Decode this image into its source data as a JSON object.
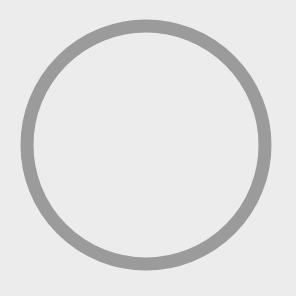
{
  "canvas": {
    "width": 296,
    "height": 296,
    "background_color": "#ececec"
  },
  "ring": {
    "shape": "circle-outline",
    "center_x": 146,
    "center_y": 145,
    "radius": 119,
    "stroke_width": 13,
    "stroke_color": "#9b9b9b",
    "fill": "none"
  }
}
